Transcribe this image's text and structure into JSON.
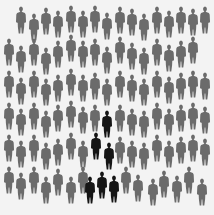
{
  "scene": {
    "description": "Crowd of gray human silhouettes with a small group of black silhouettes",
    "gray_color": "#6b6b6b",
    "highlight_color": "#151515",
    "background": "#f3f3f3"
  },
  "figures": [
    {
      "x": 20,
      "y": 6,
      "c": "g"
    },
    {
      "x": 33,
      "y": 13,
      "c": "g"
    },
    {
      "x": 45,
      "y": 7,
      "c": "g"
    },
    {
      "x": 57,
      "y": 10,
      "c": "g"
    },
    {
      "x": 70,
      "y": 5,
      "c": "g"
    },
    {
      "x": 82,
      "y": 10,
      "c": "g"
    },
    {
      "x": 94,
      "y": 5,
      "c": "g"
    },
    {
      "x": 106,
      "y": 12,
      "c": "g"
    },
    {
      "x": 119,
      "y": 6,
      "c": "g"
    },
    {
      "x": 131,
      "y": 8,
      "c": "g"
    },
    {
      "x": 143,
      "y": 13,
      "c": "g"
    },
    {
      "x": 156,
      "y": 6,
      "c": "g"
    },
    {
      "x": 168,
      "y": 10,
      "c": "g"
    },
    {
      "x": 180,
      "y": 6,
      "c": "g"
    },
    {
      "x": 192,
      "y": 8,
      "c": "g"
    },
    {
      "x": 204,
      "y": 6,
      "c": "g"
    },
    {
      "x": 8,
      "y": 38,
      "c": "g"
    },
    {
      "x": 20,
      "y": 45,
      "c": "g"
    },
    {
      "x": 33,
      "y": 38,
      "c": "g"
    },
    {
      "x": 45,
      "y": 47,
      "c": "g"
    },
    {
      "x": 57,
      "y": 40,
      "c": "g"
    },
    {
      "x": 70,
      "y": 34,
      "c": "g"
    },
    {
      "x": 82,
      "y": 40,
      "c": "g"
    },
    {
      "x": 94,
      "y": 38,
      "c": "g"
    },
    {
      "x": 106,
      "y": 46,
      "c": "g"
    },
    {
      "x": 119,
      "y": 36,
      "c": "g"
    },
    {
      "x": 131,
      "y": 42,
      "c": "g"
    },
    {
      "x": 143,
      "y": 47,
      "c": "g"
    },
    {
      "x": 156,
      "y": 38,
      "c": "g"
    },
    {
      "x": 168,
      "y": 44,
      "c": "g"
    },
    {
      "x": 180,
      "y": 40,
      "c": "g"
    },
    {
      "x": 192,
      "y": 36,
      "c": "g"
    },
    {
      "x": 8,
      "y": 70,
      "c": "g"
    },
    {
      "x": 20,
      "y": 77,
      "c": "g"
    },
    {
      "x": 33,
      "y": 70,
      "c": "g"
    },
    {
      "x": 45,
      "y": 78,
      "c": "g"
    },
    {
      "x": 57,
      "y": 74,
      "c": "g"
    },
    {
      "x": 70,
      "y": 68,
      "c": "g"
    },
    {
      "x": 82,
      "y": 74,
      "c": "g"
    },
    {
      "x": 94,
      "y": 72,
      "c": "g"
    },
    {
      "x": 106,
      "y": 78,
      "c": "g"
    },
    {
      "x": 119,
      "y": 70,
      "c": "g"
    },
    {
      "x": 131,
      "y": 74,
      "c": "g"
    },
    {
      "x": 143,
      "y": 78,
      "c": "g"
    },
    {
      "x": 156,
      "y": 70,
      "c": "g"
    },
    {
      "x": 168,
      "y": 76,
      "c": "g"
    },
    {
      "x": 180,
      "y": 72,
      "c": "g"
    },
    {
      "x": 192,
      "y": 70,
      "c": "g"
    },
    {
      "x": 204,
      "y": 72,
      "c": "g"
    },
    {
      "x": 8,
      "y": 102,
      "c": "g"
    },
    {
      "x": 20,
      "y": 108,
      "c": "g"
    },
    {
      "x": 33,
      "y": 102,
      "c": "g"
    },
    {
      "x": 45,
      "y": 110,
      "c": "g"
    },
    {
      "x": 57,
      "y": 104,
      "c": "g"
    },
    {
      "x": 70,
      "y": 100,
      "c": "g"
    },
    {
      "x": 82,
      "y": 106,
      "c": "g"
    },
    {
      "x": 94,
      "y": 104,
      "c": "g"
    },
    {
      "x": 106,
      "y": 110,
      "c": "b"
    },
    {
      "x": 119,
      "y": 104,
      "c": "g"
    },
    {
      "x": 131,
      "y": 108,
      "c": "g"
    },
    {
      "x": 143,
      "y": 110,
      "c": "g"
    },
    {
      "x": 156,
      "y": 102,
      "c": "g"
    },
    {
      "x": 168,
      "y": 108,
      "c": "g"
    },
    {
      "x": 180,
      "y": 104,
      "c": "g"
    },
    {
      "x": 192,
      "y": 102,
      "c": "g"
    },
    {
      "x": 204,
      "y": 106,
      "c": "g"
    },
    {
      "x": 8,
      "y": 134,
      "c": "g"
    },
    {
      "x": 20,
      "y": 140,
      "c": "g"
    },
    {
      "x": 33,
      "y": 134,
      "c": "g"
    },
    {
      "x": 45,
      "y": 142,
      "c": "g"
    },
    {
      "x": 57,
      "y": 138,
      "c": "g"
    },
    {
      "x": 70,
      "y": 132,
      "c": "g"
    },
    {
      "x": 82,
      "y": 140,
      "c": "g"
    },
    {
      "x": 95,
      "y": 132,
      "c": "b"
    },
    {
      "x": 108,
      "y": 142,
      "c": "b"
    },
    {
      "x": 119,
      "y": 136,
      "c": "g"
    },
    {
      "x": 131,
      "y": 140,
      "c": "g"
    },
    {
      "x": 143,
      "y": 142,
      "c": "g"
    },
    {
      "x": 156,
      "y": 134,
      "c": "g"
    },
    {
      "x": 168,
      "y": 140,
      "c": "g"
    },
    {
      "x": 180,
      "y": 136,
      "c": "g"
    },
    {
      "x": 192,
      "y": 134,
      "c": "g"
    },
    {
      "x": 204,
      "y": 138,
      "c": "g"
    },
    {
      "x": 8,
      "y": 166,
      "c": "g"
    },
    {
      "x": 20,
      "y": 172,
      "c": "g"
    },
    {
      "x": 33,
      "y": 166,
      "c": "g"
    },
    {
      "x": 45,
      "y": 176,
      "c": "g"
    },
    {
      "x": 57,
      "y": 168,
      "c": "g"
    },
    {
      "x": 70,
      "y": 176,
      "c": "g"
    },
    {
      "x": 82,
      "y": 166,
      "c": "g"
    },
    {
      "x": 89,
      "y": 176,
      "c": "b"
    },
    {
      "x": 101,
      "y": 171,
      "c": "b"
    },
    {
      "x": 113,
      "y": 175,
      "c": "b"
    },
    {
      "x": 125,
      "y": 166,
      "c": "g"
    },
    {
      "x": 137,
      "y": 174,
      "c": "g"
    },
    {
      "x": 152,
      "y": 178,
      "c": "g"
    },
    {
      "x": 163,
      "y": 170,
      "c": "g"
    },
    {
      "x": 176,
      "y": 175,
      "c": "g"
    },
    {
      "x": 188,
      "y": 166,
      "c": "g"
    },
    {
      "x": 201,
      "y": 178,
      "c": "g"
    }
  ]
}
